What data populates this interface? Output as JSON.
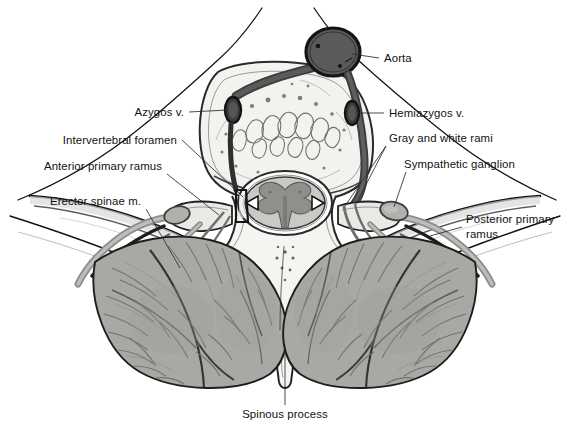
{
  "figure": {
    "type": "anatomical-illustration",
    "background": "#ffffff"
  },
  "palette": {
    "ink": "#111111",
    "leader_line": "#2b2b2b",
    "aorta_fill": "#5a5a5a",
    "vein_fill": "#4a4a4a",
    "vessel_wall": "#3c3c3c",
    "bone_fill": "#f2f2ef",
    "bone_edge": "#2a2a2a",
    "muscle_fill": "#a8a8a5",
    "muscle_shadow": "#8d8d8a",
    "muscle_stroke": "#6a6a67",
    "cord_white_matter": "#c9c9c6",
    "cord_gray_matter": "#8f8f8c",
    "nerve_fill": "#b4b4b1",
    "ganglion_fill": "#b0b0ad",
    "skin_line": "#1a1a1a",
    "label_text": "#111111"
  },
  "labels": [
    {
      "id": "aorta",
      "text": "Aorta",
      "side": "right",
      "text_x": 384,
      "text_y": 62,
      "anchor": "start",
      "leader": "M 379 58 L 352 54",
      "target": "aorta-vessel"
    },
    {
      "id": "azygos-v",
      "text": "Azygos v.",
      "side": "left",
      "text_x": 184,
      "text_y": 116,
      "anchor": "end",
      "leader": "M 189 112 L 228 110",
      "target": "azygos-vein"
    },
    {
      "id": "hemiazygos-v",
      "text": "Hemiazygos v.",
      "side": "right",
      "text_x": 389,
      "text_y": 117,
      "anchor": "start",
      "leader": "M 384 113 L 358 113",
      "target": "hemiazygos-vein"
    },
    {
      "id": "intervertebral-foramen",
      "text": "Intervertebral foramen",
      "side": "left",
      "text_x": 177,
      "text_y": 144,
      "anchor": "end",
      "leader": "M 182 140 L 243 197",
      "target": "intervertebral-foramen-region"
    },
    {
      "id": "gray-and-white-rami",
      "text": "Gray and white rami",
      "side": "right",
      "text_x": 389,
      "text_y": 142,
      "anchor": "start",
      "leader": "M 386 146 L 345 206 M 386 146 L 356 204",
      "target": "rami-communicantes"
    },
    {
      "id": "anterior-primary-ramus",
      "text": "Anterior primary ramus",
      "side": "left",
      "text_x": 162,
      "text_y": 170,
      "anchor": "end",
      "leader": "M 167 174 L 219 215",
      "target": "anterior-ramus"
    },
    {
      "id": "sympathetic-ganglion",
      "text": "Sympathetic ganglion",
      "side": "right",
      "text_x": 404,
      "text_y": 168,
      "anchor": "start",
      "leader": "M 406 172 L 394 207",
      "target": "sympathetic-ganglion-body"
    },
    {
      "id": "erector-spinae-m",
      "text": "Erector spinae m.",
      "side": "left",
      "text_x": 141,
      "text_y": 205,
      "anchor": "end",
      "leader": "M 146 209 L 180 268",
      "target": "erector-spinae-muscle-left"
    },
    {
      "id": "posterior-primary-ramus",
      "text": "Posterior primary\nramus",
      "text_line1": "Posterior primary",
      "text_line2": "ramus",
      "side": "right",
      "text_x": 466,
      "text_y": 223,
      "anchor": "start",
      "leader": "M 462 227 L 430 236",
      "target": "posterior-ramus"
    },
    {
      "id": "spinous-process",
      "text": "Spinous process",
      "side": "bottom",
      "text_x": 285,
      "text_y": 418,
      "anchor": "middle",
      "leader": "M 285 405 L 285 352",
      "target": "spinous-process-body"
    }
  ],
  "structures": [
    {
      "id": "aorta-vessel",
      "name": "Aorta",
      "kind": "artery"
    },
    {
      "id": "azygos-vein",
      "name": "Azygos v.",
      "kind": "vein"
    },
    {
      "id": "hemiazygos-vein",
      "name": "Hemiazygos v.",
      "kind": "vein"
    },
    {
      "id": "vertebral-body",
      "name": "Vertebral body",
      "kind": "bone"
    },
    {
      "id": "spinal-cord",
      "name": "Spinal cord",
      "kind": "neural"
    },
    {
      "id": "gray-matter",
      "name": "Gray matter",
      "kind": "neural"
    },
    {
      "id": "sympathetic-ganglion-body",
      "name": "Sympathetic ganglion",
      "kind": "neural"
    },
    {
      "id": "anterior-ramus",
      "name": "Anterior primary ramus",
      "kind": "nerve"
    },
    {
      "id": "posterior-ramus",
      "name": "Posterior primary ramus",
      "kind": "nerve"
    },
    {
      "id": "rami-communicantes",
      "name": "Gray and white rami",
      "kind": "nerve"
    },
    {
      "id": "erector-spinae-muscle-left",
      "name": "Erector spinae m. (left)",
      "kind": "muscle"
    },
    {
      "id": "erector-spinae-muscle-right",
      "name": "Erector spinae m. (right)",
      "kind": "muscle"
    },
    {
      "id": "spinous-process-body",
      "name": "Spinous process",
      "kind": "bone"
    },
    {
      "id": "rib-left",
      "name": "Rib (left)",
      "kind": "bone"
    },
    {
      "id": "rib-right",
      "name": "Rib (right)",
      "kind": "bone"
    }
  ]
}
